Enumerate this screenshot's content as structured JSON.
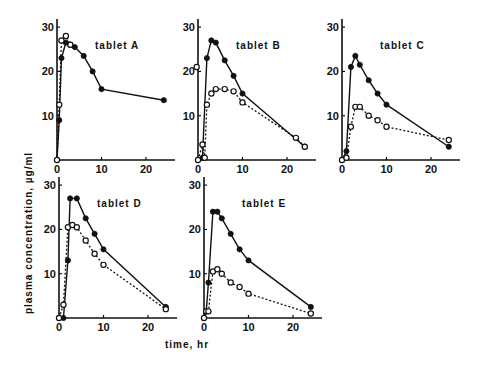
{
  "chart_data": {
    "type": "line",
    "ylabel": "plasma concentration, µg/ml",
    "xlabel": "time, hr",
    "xlim": [
      0,
      25
    ],
    "ylim": [
      0,
      30
    ],
    "xticks": [
      0,
      10,
      20
    ],
    "yticks": [
      10,
      20,
      30
    ],
    "series_styles": {
      "filled": "solid line, filled circles",
      "open": "dotted line, open circles"
    },
    "panels": [
      {
        "title": "tablet A",
        "series": [
          {
            "name": "filled",
            "x": [
              0,
              0.5,
              1,
              2,
              3,
              4,
              6,
              8,
              10,
              24
            ],
            "y": [
              0,
              9,
              23,
              26.5,
              26,
              25.5,
              23.5,
              20,
              16,
              13.5,
              3
            ]
          },
          {
            "name": "open",
            "x": [
              0,
              0.5,
              1,
              2,
              3
            ],
            "y": [
              0,
              12.5,
              27,
              28,
              26
            ]
          }
        ]
      },
      {
        "title": "tablet B",
        "series": [
          {
            "name": "filled",
            "x": [
              0,
              1,
              2,
              3,
              4,
              6,
              8,
              10,
              24
            ],
            "y": [
              0,
              0.5,
              23,
              27,
              26.5,
              22.5,
              19,
              15,
              3
            ]
          },
          {
            "name": "open",
            "x": [
              -0.3,
              0,
              1,
              1.5,
              2,
              3,
              4,
              6,
              8,
              10,
              22,
              24
            ],
            "y": [
              21,
              0,
              3.5,
              0.5,
              12.5,
              15,
              16,
              16,
              15.5,
              13,
              5,
              3
            ]
          }
        ]
      },
      {
        "title": "tablet C",
        "series": [
          {
            "name": "filled",
            "x": [
              0,
              1,
              2,
              3,
              4,
              6,
              8,
              10,
              24
            ],
            "y": [
              0,
              2,
              21,
              23.5,
              21.5,
              18,
              15,
              12.5,
              3
            ]
          },
          {
            "name": "open",
            "x": [
              0,
              1,
              2,
              3,
              4,
              6,
              8,
              10,
              24
            ],
            "y": [
              0,
              0.5,
              7.5,
              12,
              12,
              10,
              9,
              7.5,
              4.5
            ]
          }
        ]
      },
      {
        "title": "tablet D",
        "series": [
          {
            "name": "filled",
            "x": [
              0,
              1,
              2,
              2.5,
              4,
              6,
              8,
              10,
              24
            ],
            "y": [
              0,
              0,
              13,
              27,
              27,
              22.5,
              19,
              15.5,
              2.5
            ]
          },
          {
            "name": "open",
            "x": [
              0,
              1,
              2,
              3,
              4,
              6,
              8,
              10,
              24
            ],
            "y": [
              0,
              3,
              20.5,
              21,
              20.5,
              17.5,
              14.5,
              12,
              2
            ]
          }
        ]
      },
      {
        "title": "tablet E",
        "series": [
          {
            "name": "filled",
            "x": [
              0,
              0.5,
              1,
              2,
              3,
              4,
              6,
              8,
              10,
              24
            ],
            "y": [
              0,
              1.5,
              8,
              24,
              24,
              22.5,
              19,
              15.5,
              13,
              2.5
            ]
          },
          {
            "name": "open",
            "x": [
              0,
              0.5,
              1,
              2,
              3,
              4,
              6,
              8,
              10,
              24
            ],
            "y": [
              0,
              1.5,
              1.5,
              10.5,
              11,
              10,
              8,
              7,
              5.5,
              1
            ]
          }
        ]
      }
    ]
  }
}
